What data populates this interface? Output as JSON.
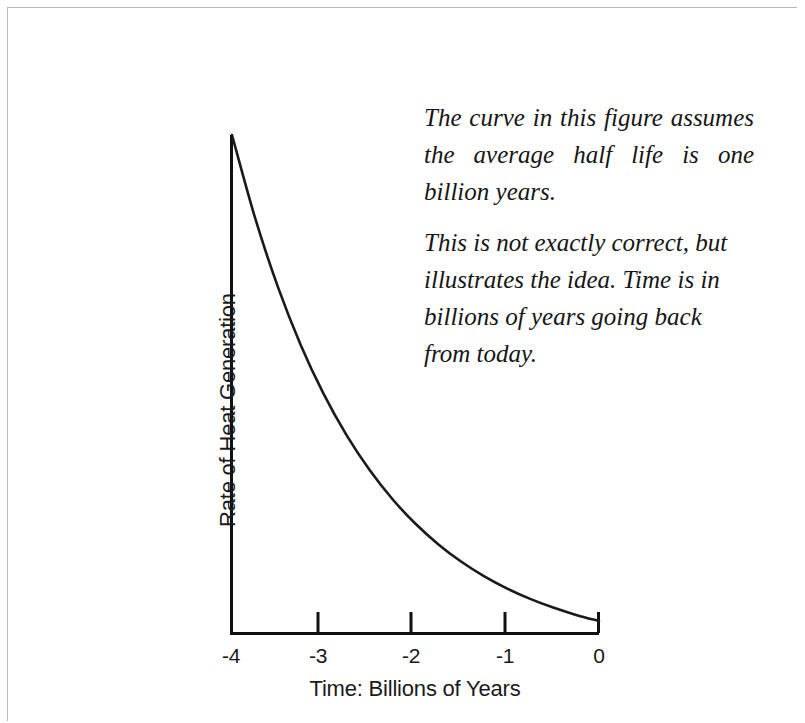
{
  "figure": {
    "annotation": {
      "paragraph_1": "The curve in this figure assumes the average half life is one billion years.",
      "paragraph_2": "This is not exactly correct, but illustrates the idea. Time is in billions of years going back from today."
    }
  },
  "chart_data": {
    "type": "line",
    "title": "",
    "subtitle": "",
    "xlabel": "Time: Billions of Years",
    "ylabel": "Rate of Heat Generation",
    "xlim": [
      -4,
      0
    ],
    "ylim": [
      0,
      16
    ],
    "xticks": [
      -4,
      -3,
      -2,
      -1,
      0
    ],
    "xticklabels": [
      "-4",
      "-3",
      "-2",
      "-1",
      "0"
    ],
    "yticks": [],
    "yticklabels": [],
    "grid": false,
    "legend": null,
    "line_color": "#1a1a1a",
    "line_width": 2,
    "series": [
      {
        "name": "Rate of Heat Generation",
        "x": [
          -4.0,
          -3.75,
          -3.5,
          -3.25,
          -3.0,
          -2.75,
          -2.5,
          -2.25,
          -2.0,
          -1.75,
          -1.5,
          -1.25,
          -1.0,
          -0.75,
          -0.5,
          -0.25,
          0.0
        ],
        "values": [
          16.0,
          13.454,
          11.314,
          9.514,
          8.0,
          6.727,
          5.657,
          4.757,
          4.0,
          3.364,
          2.828,
          2.378,
          2.0,
          1.682,
          1.414,
          1.189,
          1.0
        ]
      }
    ],
    "annotations": [
      {
        "text": "The curve in this figure assumes the average half life is one billion years.",
        "position": "upper-right"
      },
      {
        "text": "This is not exactly correct, but illustrates the idea. Time is in billions of years going back from today.",
        "position": "upper-right"
      }
    ]
  }
}
